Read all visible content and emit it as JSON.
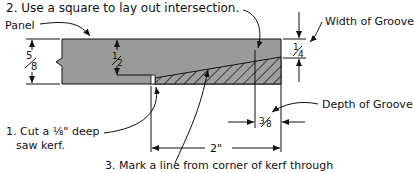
{
  "diagram": {
    "steps": {
      "step1_line1": "1. Cut a ⅛\" deep",
      "step1_line2": "saw kerf.",
      "step2": "2. Use a square to lay out intersection.",
      "step3": "3. Mark a line from corner of kerf through"
    },
    "labels": {
      "panel": "Panel",
      "width_of_groove": "Width of Groove",
      "depth_of_groove": "Depth of Groove"
    },
    "dimensions": {
      "panel_thickness": "5/8\"",
      "panel_thickness_num": "5",
      "panel_thickness_den": "8",
      "kerf_height": "1/2\"",
      "kerf_height_num": "1",
      "kerf_height_den": "2",
      "groove_width": "1/4\"",
      "groove_width_num": "1",
      "groove_width_den": "4",
      "groove_depth": "3/8\"",
      "groove_depth_num": "3",
      "groove_depth_den": "8",
      "overall_length": "2\""
    },
    "colors": {
      "panel_fill": "#9a9a9a",
      "hatch": "#222222",
      "line": "#111111"
    }
  }
}
